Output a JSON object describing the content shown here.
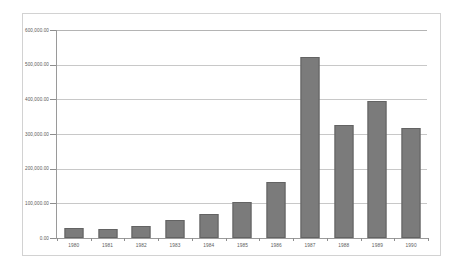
{
  "chart_data": {
    "type": "bar",
    "title": "",
    "xlabel": "",
    "ylabel": "",
    "categories": [
      "1980",
      "1981",
      "1982",
      "1983",
      "1984",
      "1985",
      "1986",
      "1987",
      "1988",
      "1989",
      "1990"
    ],
    "values": [
      29000,
      27000,
      34000,
      51000,
      69000,
      103000,
      163000,
      522000,
      327000,
      396000,
      318000
    ],
    "ylim": [
      0,
      600000
    ],
    "ytick_values": [
      0,
      100000,
      200000,
      300000,
      400000,
      500000,
      600000
    ],
    "ytick_labels": [
      "0.00",
      "100,000.00",
      "200,000.00",
      "300,000.00",
      "400,000.00",
      "500,000.00",
      "600,000.00"
    ],
    "grid": true,
    "legend": "none",
    "series_name": "",
    "colors": {
      "bar_fill": "#7b7b7b",
      "bar_border": "#636363",
      "gridline": "#c8c8c8",
      "axis": "#9a9a9a",
      "frame": "#d2d2d2",
      "label_text": "#5d5d5d",
      "plot_background": "#ffffff"
    }
  }
}
